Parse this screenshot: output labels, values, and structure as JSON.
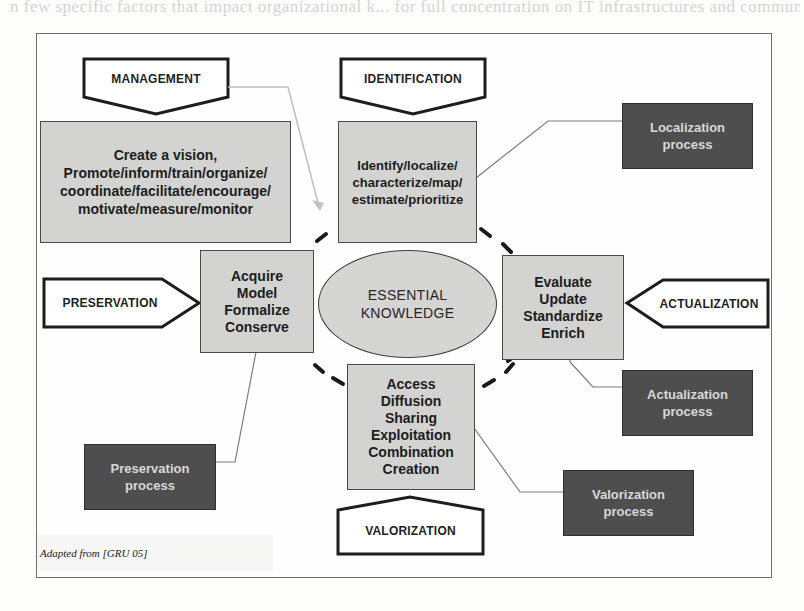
{
  "page": {
    "bleed_through_text": "n  few  specific  factors  that  impact  organizational  k...  for  full  concentration  on  IT  infrastructures  and  communication  tools  ...  in"
  },
  "diagram": {
    "center": {
      "label": "ESSENTIAL\nKNOWLEDGE"
    },
    "phases": [
      {
        "id": "management",
        "label": "MANAGEMENT",
        "shape": "pentagon-down",
        "activity": "Create a vision,\nPromote/inform/train/organize/\ncoordinate/facilitate/encourage/\nmotivate/measure/monitor"
      },
      {
        "id": "identification",
        "label": "IDENTIFICATION",
        "shape": "pentagon-down",
        "activity": "Identify/localize/\ncharacterize/map/\nestimate/prioritize",
        "process": "Localization\nprocess"
      },
      {
        "id": "preservation",
        "label": "PRESERVATION",
        "shape": "pentagon-right",
        "activity": "Acquire\nModel\nFormalize\nConserve",
        "process": "Preservation\nprocess"
      },
      {
        "id": "actualization",
        "label": "ACTUALIZATION",
        "shape": "pentagon-left",
        "activity": "Evaluate\nUpdate\nStandardize\nEnrich",
        "process": "Actualization\nprocess"
      },
      {
        "id": "valorization",
        "label": "VALORIZATION",
        "shape": "pentagon-up",
        "activity": "Access\nDiffusion\nSharing\nExploitation\nCombination\nCreation",
        "process": "Valorization\nprocess"
      }
    ],
    "caption": "Adapted from [GRU 05]",
    "colors": {
      "activity_box": "#d3d3d2",
      "process_box": "#4e4e4e",
      "process_text": "#d8d8d8",
      "outline": "#1f1f1f",
      "arrow_light": "#bdbdbd"
    }
  }
}
